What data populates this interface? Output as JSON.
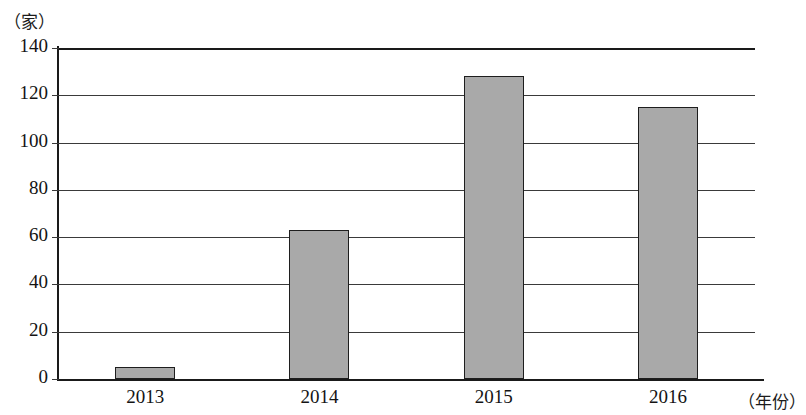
{
  "chart_data": {
    "type": "bar",
    "title": "",
    "subtitle": "",
    "xlabel": "（年份）",
    "ylabel": "（家）",
    "categories": [
      "2013",
      "2014",
      "2015",
      "2016"
    ],
    "values": [
      5,
      63,
      128,
      115
    ],
    "series": [
      {
        "name": "",
        "values": [
          5,
          63,
          128,
          115
        ]
      }
    ],
    "ylim": [
      0,
      140
    ],
    "y_ticks": [
      "0",
      "20",
      "40",
      "60",
      "80",
      "100",
      "120",
      "140"
    ],
    "y_tick_values": [
      0,
      20,
      40,
      60,
      80,
      100,
      120,
      140
    ],
    "grid": "horizontal",
    "legend": "none",
    "legend_position": "none",
    "annotations": [],
    "colors": {
      "bar_fill": "#a9a9a9",
      "bar_border": "#1e1e1e",
      "gridline": "#3a3a3a",
      "axis": "#1a1a1a",
      "text": "#141414",
      "background": "#ffffff"
    }
  }
}
